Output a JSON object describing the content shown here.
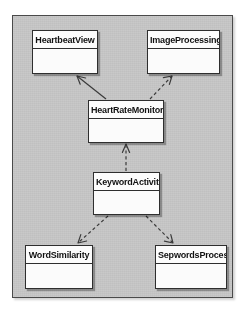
{
  "diagram": {
    "kind": "uml-class-diagram",
    "background_color": "#ffffff",
    "canvas_color": "#c9c9c9",
    "canvas_border_color": "#4a4a4a",
    "box_fill_color": "#fbfbfb",
    "box_border_color": "#2e2e2e",
    "connector_color": "#3a3a3a",
    "classes": [
      {
        "id": "heartbeatview",
        "name": "HeartbeatView",
        "x": 32,
        "y": 30,
        "width": 66,
        "height": 44
      },
      {
        "id": "imageprocessing",
        "name": "ImageProcessing",
        "x": 147,
        "y": 30,
        "width": 73,
        "height": 44
      },
      {
        "id": "heartratemonitor",
        "name": "HeartRateMonitor",
        "x": 88,
        "y": 100,
        "width": 76,
        "height": 43
      },
      {
        "id": "keywordactivity",
        "name": "KeywordActivity",
        "x": 93,
        "y": 172,
        "width": 67,
        "height": 43
      },
      {
        "id": "wordsimilarity",
        "name": "WordSimilarity",
        "x": 25,
        "y": 245,
        "width": 68,
        "height": 44
      },
      {
        "id": "sepwordsprocess",
        "name": "SepwordsProcess",
        "x": 155,
        "y": 245,
        "width": 72,
        "height": 44
      }
    ],
    "relations": [
      {
        "id": "rel-hrm-hbv",
        "from": "heartratemonitor",
        "to": "heartbeatview",
        "style": "solid",
        "arrowhead": "open"
      },
      {
        "id": "rel-hrm-ip",
        "from": "heartratemonitor",
        "to": "imageprocessing",
        "style": "dashed",
        "arrowhead": "open"
      },
      {
        "id": "rel-ka-hrm",
        "from": "keywordactivity",
        "to": "heartratemonitor",
        "style": "dashed",
        "arrowhead": "open"
      },
      {
        "id": "rel-ka-ws",
        "from": "keywordactivity",
        "to": "wordsimilarity",
        "style": "dashed",
        "arrowhead": "open"
      },
      {
        "id": "rel-ka-sp",
        "from": "keywordactivity",
        "to": "sepwordsprocess",
        "style": "dashed",
        "arrowhead": "open"
      }
    ]
  }
}
